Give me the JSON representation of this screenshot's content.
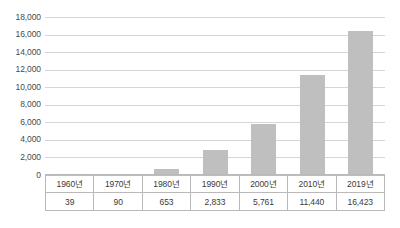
{
  "chart_data": {
    "type": "bar",
    "title": "",
    "xlabel": "",
    "ylabel": "",
    "categories": [
      "1960년",
      "1970년",
      "1980년",
      "1990년",
      "2000년",
      "2010년",
      "2019년"
    ],
    "values": [
      39,
      90,
      653,
      2833,
      5761,
      11440,
      16423
    ],
    "value_labels": [
      "39",
      "90",
      "653",
      "2,833",
      "5,761",
      "11,440",
      "16,423"
    ],
    "ylim": [
      0,
      18000
    ],
    "ytick_values": [
      18000,
      16000,
      14000,
      12000,
      10000,
      8000,
      6000,
      4000,
      2000,
      0
    ],
    "ytick_labels": [
      "18,000",
      "16,000",
      "14,000",
      "12,000",
      "10,000",
      "8,000",
      "6,000",
      "4,000",
      "2,000",
      "0"
    ],
    "grid": true,
    "legend": false,
    "legend_position": "none",
    "bar_color": "#bfbfbf",
    "gridline_color": "#d6d6d6",
    "table_border_color": "#b9b9b9",
    "text_color": "#3a3a3a"
  },
  "table": {
    "header_row": [
      "1960년",
      "1970년",
      "1980년",
      "1990년",
      "2000년",
      "2010년",
      "2019년"
    ],
    "value_row": [
      "39",
      "90",
      "653",
      "2,833",
      "5,761",
      "11,440",
      "16,423"
    ]
  }
}
